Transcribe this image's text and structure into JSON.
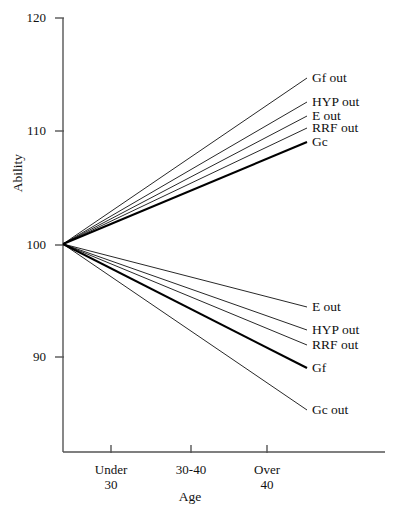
{
  "chart_data": {
    "type": "line",
    "title": "",
    "subtitle": "",
    "xlabel": "Age",
    "ylabel": "Ability",
    "categories": [
      "Under 30",
      "30-40",
      "Over 40"
    ],
    "x": [
      1,
      2,
      3
    ],
    "xtick_labels": [
      "Under\n30",
      "30-40",
      "Over\n40"
    ],
    "ytick_labels": [
      "120",
      "110",
      "100",
      "90"
    ],
    "yticks": [
      120,
      110,
      100,
      90
    ],
    "ylim": [
      85,
      120
    ],
    "xlim": [
      0.5,
      3.8
    ],
    "grid": false,
    "legend_position": "right-of-line-ends",
    "note": "Fan diagram: all series originate at Ability = 100 at the 'Under 30' anchor and diverge linearly to the right edge.",
    "series": [
      {
        "name": "Gf out",
        "label": "Gf out",
        "origin": 100,
        "end_value": 114.7,
        "weight": "thin",
        "direction": "up",
        "label_y_px": 78
      },
      {
        "name": "HYP out",
        "label": "HYP out",
        "origin": 100,
        "end_value": 112.6,
        "weight": "thin",
        "direction": "up",
        "label_y_px": 102
      },
      {
        "name": "E out",
        "label": "E out",
        "origin": 100,
        "end_value": 111.4,
        "weight": "thin",
        "direction": "up",
        "label_y_px": 116
      },
      {
        "name": "RRF out",
        "label": "RRF out",
        "origin": 100,
        "end_value": 110.3,
        "weight": "thin",
        "direction": "up",
        "label_y_px": 128
      },
      {
        "name": "Gc",
        "label": "Gc",
        "origin": 100,
        "end_value": 109.1,
        "weight": "bold",
        "direction": "up",
        "label_y_px": 142
      },
      {
        "name": "E out 2",
        "label": "E out",
        "origin": 100,
        "end_value": 94.5,
        "weight": "thin",
        "direction": "down",
        "label_y_px": 307
      },
      {
        "name": "HYP out 2",
        "label": "HYP out",
        "origin": 100,
        "end_value": 92.5,
        "weight": "thin",
        "direction": "down",
        "label_y_px": 330
      },
      {
        "name": "RRF out 2",
        "label": "RRF out",
        "origin": 100,
        "end_value": 91.2,
        "weight": "thin",
        "direction": "down",
        "label_y_px": 345
      },
      {
        "name": "Gf",
        "label": "Gf",
        "origin": 100,
        "end_value": 89.2,
        "weight": "bold",
        "direction": "down",
        "label_y_px": 368
      },
      {
        "name": "Gc out",
        "label": "Gc out",
        "origin": 100,
        "end_value": 85.5,
        "weight": "thin",
        "direction": "down",
        "label_y_px": 410
      }
    ]
  },
  "axis": {
    "y_label": "Ability",
    "x_label": "Age",
    "y_ticks": [
      {
        "value": "120",
        "y_px": 18
      },
      {
        "value": "110",
        "y_px": 131
      },
      {
        "value": "100",
        "y_px": 245
      },
      {
        "value": "90",
        "y_px": 357
      }
    ],
    "x_ticks": [
      {
        "line1": "Under",
        "line2": "30",
        "x_px": 111
      },
      {
        "line1": "30-40",
        "line2": "",
        "x_px": 191
      },
      {
        "line1": "Over",
        "line2": "40",
        "x_px": 267
      }
    ],
    "axis_color": "#555555",
    "line_color": "#000000"
  },
  "series_labels_up": [
    {
      "text": "Gf out",
      "y_px": 78
    },
    {
      "text": "HYP out",
      "y_px": 102
    },
    {
      "text": "E out",
      "y_px": 116
    },
    {
      "text": "RRF out",
      "y_px": 128
    },
    {
      "text": "Gc",
      "y_px": 142
    }
  ],
  "series_labels_down": [
    {
      "text": "E out",
      "y_px": 307
    },
    {
      "text": "HYP out",
      "y_px": 330
    },
    {
      "text": "RRF out",
      "y_px": 345
    },
    {
      "text": "Gf",
      "y_px": 368
    },
    {
      "text": "Gc out",
      "y_px": 410
    }
  ]
}
